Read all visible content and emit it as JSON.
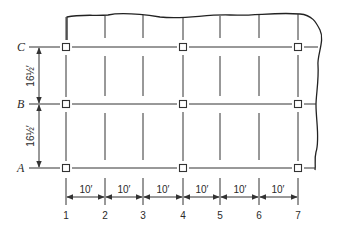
{
  "figure": {
    "type": "column-grid-plan",
    "colors": {
      "line": "#333333",
      "background": "#ffffff"
    }
  },
  "rows": [
    {
      "label": "C",
      "y": 47
    },
    {
      "label": "B",
      "y": 104
    },
    {
      "label": "A",
      "y": 168
    }
  ],
  "columns": [
    {
      "label": "1",
      "x": 66
    },
    {
      "label": "2",
      "x": 105
    },
    {
      "label": "3",
      "x": 143
    },
    {
      "label": "4",
      "x": 183
    },
    {
      "label": "5",
      "x": 220
    },
    {
      "label": "6",
      "x": 259
    },
    {
      "label": "7",
      "x": 298
    }
  ],
  "columns_with_markers": [
    "1",
    "4",
    "7"
  ],
  "vertical_dimensions": [
    {
      "from": "A",
      "to": "B",
      "text": "16½′"
    },
    {
      "from": "B",
      "to": "C",
      "text": "16½′"
    }
  ],
  "horizontal_dimensions": [
    {
      "from": "1",
      "to": "2",
      "text": "10′"
    },
    {
      "from": "2",
      "to": "3",
      "text": "10′"
    },
    {
      "from": "3",
      "to": "4",
      "text": "10′"
    },
    {
      "from": "4",
      "to": "5",
      "text": "10′"
    },
    {
      "from": "5",
      "to": "6",
      "text": "10′"
    },
    {
      "from": "6",
      "to": "7",
      "text": "10′"
    }
  ],
  "labels": {
    "row_c": "C",
    "row_b": "B",
    "row_a": "A",
    "dim_bc": "16½′",
    "dim_ab": "16½′",
    "dim_12": "10′",
    "dim_23": "10′",
    "dim_34": "10′",
    "dim_45": "10′",
    "dim_56": "10′",
    "dim_67": "10′",
    "col_1": "1",
    "col_2": "2",
    "col_3": "3",
    "col_4": "4",
    "col_5": "5",
    "col_6": "6",
    "col_7": "7"
  }
}
